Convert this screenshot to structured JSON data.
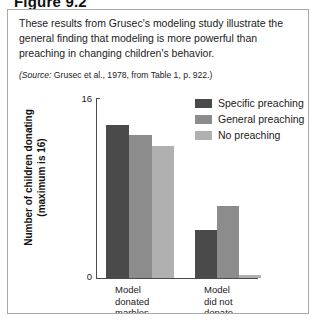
{
  "figure": {
    "number_label": "Figure 9.2",
    "caption": "These results from Grusec's modeling study illustrate the general finding that modeling is more powerful than preaching in changing children's behavior.",
    "source_prefix": "(Source:",
    "source_rest": " Grusec et al., 1978, from Table 1, p. 922.)"
  },
  "colors": {
    "specific_preaching": "#4a4a4a",
    "general_preaching": "#8c8c8c",
    "no_preaching": "#b0b0b0",
    "axis": "#4a4a4a",
    "border": "#a9a9a9",
    "text": "#1b1b1b"
  },
  "chart_data": {
    "type": "bar",
    "title": "",
    "xlabel": "",
    "ylabel": "Number of children donating (maximum is 16)",
    "ylim": [
      0,
      16
    ],
    "ytick_labels": [
      "0",
      "16"
    ],
    "yticks": [
      0,
      16
    ],
    "grid": false,
    "legend_position": "top-right",
    "categories": [
      "Model donated marbles",
      "Model did not donate marbles"
    ],
    "category_lines": [
      [
        "Model",
        "donated",
        "marbles"
      ],
      [
        "Model",
        "did not",
        "donate",
        "marbles"
      ]
    ],
    "series": [
      {
        "name": "Specific preaching",
        "color": "#4a4a4a",
        "values": [
          13.6,
          4.3
        ]
      },
      {
        "name": "General preaching",
        "color": "#8c8c8c",
        "values": [
          12.7,
          6.4
        ]
      },
      {
        "name": "No preaching",
        "color": "#b0b0b0",
        "values": [
          11.7,
          0.3
        ]
      }
    ]
  }
}
